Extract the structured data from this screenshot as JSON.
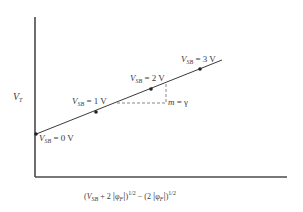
{
  "diagram": {
    "y_axis_label": {
      "main": "V",
      "sub": "T"
    },
    "x_axis_label": {
      "open": "(",
      "v": "V",
      "v_sub": "SB",
      "plus": " + 2 ",
      "phi": "φ",
      "phi_sub": "F",
      "close_exp": "1/2",
      "minus": " − (2 ",
      "phi2": "φ",
      "phi2_sub": "F",
      "close_exp2": "1/2"
    },
    "points": [
      {
        "label_v": "V",
        "label_sub": "SB",
        "label_val": " = 0 V",
        "x": 36,
        "y": 134
      },
      {
        "label_v": "V",
        "label_sub": "SB",
        "label_val": " = 1 V",
        "x": 96,
        "y": 112
      },
      {
        "label_v": "V",
        "label_sub": "SB",
        "label_val": " = 2 V",
        "x": 151,
        "y": 89
      },
      {
        "label_v": "V",
        "label_sub": "SB",
        "label_val": " = 3 V",
        "x": 200,
        "y": 69
      }
    ],
    "slope_label": {
      "m": "m",
      "eq": " = γ"
    },
    "colors": {
      "line": "#3a3a3a",
      "axis": "#4a4a4a",
      "dash": "#6a6a6a"
    }
  }
}
